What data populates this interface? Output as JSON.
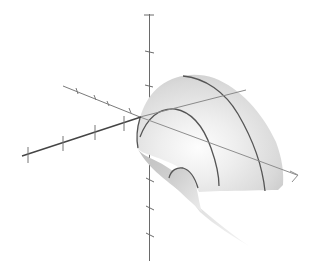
{
  "figure": {
    "type": "3d-surface-plot",
    "background": "#ffffff",
    "surface_color_light": "#f2f2f2",
    "surface_color_mid": "#d6d6d6",
    "surface_color_dark": "#b4b4b4",
    "curve_color": "#555555",
    "axis_color": "#6a6a6a",
    "front_axis_color": "#444444",
    "axes": {
      "vertical": {
        "ticks": 7
      },
      "front_left": {
        "ticks": 4
      },
      "back_left": {
        "ticks": 4
      },
      "back_right": {
        "ticks": 0
      }
    },
    "meridian_curves": 3,
    "labels": []
  }
}
